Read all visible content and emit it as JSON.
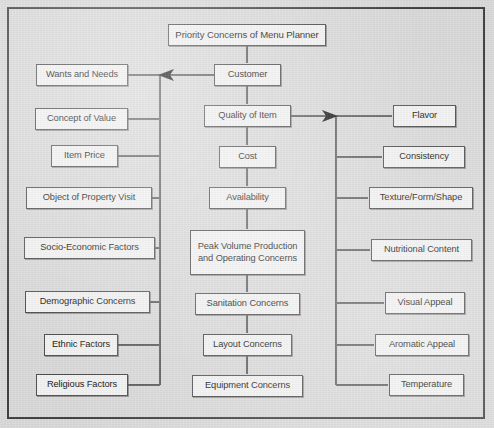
{
  "diagram": {
    "title": "Priority Concerns of Menu Planner",
    "background_color": "#d9d9d9",
    "node_fill_color": "#f2f2f2",
    "node_border_color": "#4a4a4a",
    "frame_border_color": "#3c3c3c",
    "root": {
      "label": "Priority Concerns of Menu Planner"
    },
    "spine": [
      {
        "label": "Customer"
      },
      {
        "label": "Quality of Item"
      },
      {
        "label": "Cost"
      },
      {
        "label": "Availability"
      },
      {
        "label": "Peak Volume Production\nand Operating Concerns"
      },
      {
        "label": "Sanitation Concerns"
      },
      {
        "label": "Layout Concerns"
      },
      {
        "label": "Equipment Concerns"
      }
    ],
    "customer_branches": [
      {
        "label": "Wants and Needs"
      },
      {
        "label": "Concept of Value"
      },
      {
        "label": "Item Price"
      },
      {
        "label": "Object of Property Visit"
      },
      {
        "label": "Socio-Economic Factors"
      },
      {
        "label": "Demographic Concerns"
      },
      {
        "label": "Ethnic Factors"
      },
      {
        "label": "Religious Factors"
      }
    ],
    "quality_branches": [
      {
        "label": "Flavor"
      },
      {
        "label": "Consistency"
      },
      {
        "label": "Texture/Form/Shape"
      },
      {
        "label": "Nutritional Content"
      },
      {
        "label": "Visual Appeal"
      },
      {
        "label": "Aromatic Appeal"
      },
      {
        "label": "Temperature"
      }
    ]
  }
}
